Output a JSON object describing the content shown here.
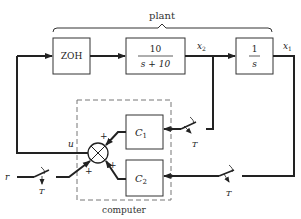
{
  "diagram": {
    "plant_label": "plant",
    "computer_label": "computer",
    "blocks": {
      "zoh": {
        "label": "ZOH"
      },
      "first_order": {
        "numerator": "10",
        "denominator": "s + 10"
      },
      "integrator": {
        "numerator": "1",
        "denominator": "s"
      },
      "c1": {
        "label": "C",
        "subscript": "1"
      },
      "c2": {
        "label": "C",
        "subscript": "2"
      }
    },
    "signals": {
      "x2": {
        "label": "x",
        "subscript": "2"
      },
      "x1": {
        "label": "x",
        "subscript": "1"
      },
      "u": "u",
      "r": "r"
    },
    "sampler_label": "T",
    "summing_signs": {
      "from_c1": "+",
      "from_c2": "+",
      "from_r": "+"
    },
    "colors": {
      "line": "#222222",
      "dashed_box": "#777777",
      "background": "#ffffff"
    }
  }
}
